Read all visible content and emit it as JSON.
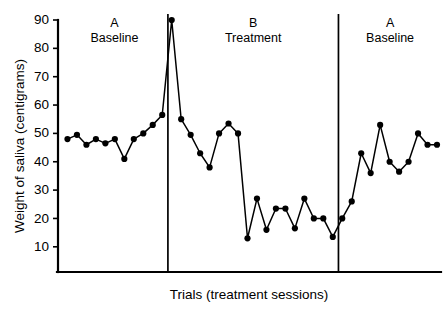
{
  "chart_data": {
    "type": "line",
    "title": "",
    "subtitle": "",
    "xlabel": "Trials (treatment sessions)",
    "ylabel": "Weight of saliva (centigrams)",
    "ylim": [
      0,
      90
    ],
    "xlim": [
      0,
      40
    ],
    "grid": false,
    "legend": null,
    "y_ticks": [
      10,
      20,
      30,
      40,
      50,
      60,
      70,
      80,
      90
    ],
    "y_tick_labels": [
      "10",
      "20",
      "30",
      "40",
      "50",
      "60",
      "70",
      "80",
      "90"
    ],
    "x_ticks": [],
    "x_tick_labels": [],
    "marker": "filled-circle",
    "marker_color": "#000000",
    "line_color": "#000000",
    "series": [
      {
        "name": "Weight of saliva",
        "x": [
          1,
          2,
          3,
          4,
          5,
          6,
          7,
          8,
          9,
          10,
          11,
          12,
          13,
          14,
          15,
          16,
          17,
          18,
          19,
          20,
          21,
          22,
          23,
          24,
          25,
          26,
          27,
          28,
          29,
          30,
          31,
          32,
          33,
          34,
          35,
          36,
          37,
          38,
          39,
          40
        ],
        "values": [
          48,
          49.5,
          46,
          48,
          46.5,
          48,
          41,
          48,
          50,
          53,
          56.5,
          90,
          55,
          49.5,
          43,
          38,
          50,
          53.5,
          50,
          13,
          27,
          16,
          23.5,
          23.5,
          16.5,
          27,
          20,
          20,
          13.5,
          20,
          26,
          43,
          36,
          53,
          40,
          36.5,
          40,
          50,
          46,
          46
        ]
      }
    ],
    "phases": [
      {
        "id": "phase-a1",
        "letter": "A",
        "name": "Baseline",
        "x_start": 0.3,
        "x_end": 11.6
      },
      {
        "id": "phase-b",
        "letter": "B",
        "name": "Treatment",
        "x_start": 11.6,
        "x_end": 29.6
      },
      {
        "id": "phase-a2",
        "letter": "A",
        "name": "Baseline",
        "x_start": 29.6,
        "x_end": 40.5
      }
    ],
    "phase_divider_x": [
      11.6,
      29.6
    ],
    "colors": {
      "ink": "#000000",
      "background": "#ffffff"
    }
  }
}
